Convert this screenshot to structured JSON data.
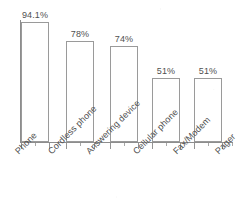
{
  "chart_data": {
    "type": "bar",
    "title": "",
    "subtitle": "",
    "xlabel": "",
    "ylabel": "",
    "categories": [
      "Phone",
      "Cordless phone",
      "Answering device",
      "Cellular phone",
      "Fax/Modem",
      "Pager"
    ],
    "values": [
      94.1,
      78,
      74,
      51,
      51,
      28
    ],
    "value_labels": [
      "94.1%",
      "78%",
      "74%",
      "51%",
      "51%",
      "28%"
    ],
    "ylim": [
      0,
      100
    ],
    "grid": false,
    "legend": null,
    "y_tick_labels": [],
    "orientation": "vertical",
    "bar_fill": "#ffffff",
    "bar_stroke": "#9a9a9a",
    "axis_color": "#8d8d8d",
    "text_color": "#4f4f4f",
    "label_rotation_deg": -45,
    "bars": [
      {
        "category": "Phone",
        "value": 94.1,
        "label": "94.1%",
        "x": 21,
        "width": 28,
        "top": 22,
        "value_label_x": 17,
        "value_label_y": 10,
        "value_label_w": 36
      },
      {
        "category": "Cordless phone",
        "value": 78,
        "label": "78%",
        "x": 66,
        "width": 28,
        "top": 41,
        "value_label_x": 65,
        "value_label_y": 29,
        "value_label_w": 30
      },
      {
        "category": "Answering device",
        "value": 74,
        "label": "74%",
        "x": 110,
        "width": 28,
        "top": 46,
        "value_label_x": 109,
        "value_label_y": 34,
        "value_label_w": 30
      },
      {
        "category": "Cellular phone",
        "value": 51,
        "label": "51%",
        "x": 152,
        "width": 28,
        "top": 78,
        "value_label_x": 151,
        "value_label_y": 66,
        "value_label_w": 30
      },
      {
        "category": "Fax/Modem",
        "value": 51,
        "label": "51%",
        "x": 194,
        "width": 28,
        "top": 78,
        "value_label_x": 193,
        "value_label_y": 66,
        "value_label_w": 30
      },
      {
        "category": "Pager",
        "value": 28,
        "label": "28%",
        "x": 252,
        "width": 28,
        "top": 110,
        "value_label_x": 251,
        "value_label_y": 98,
        "value_label_w": 30
      }
    ],
    "category_label_positions": [
      {
        "label": "Phone",
        "x": 13,
        "y": 149
      },
      {
        "label": "Cordless phone",
        "x": 46,
        "y": 149
      },
      {
        "label": "Answering device",
        "x": 84,
        "y": 149
      },
      {
        "label": "Cellular phone",
        "x": 131,
        "y": 149
      },
      {
        "label": "Fax/Modem",
        "x": 171,
        "y": 149
      },
      {
        "label": "Pager",
        "x": 213,
        "y": 149
      }
    ],
    "tick_major_x": [
      21,
      49,
      66,
      94,
      110,
      138,
      152,
      180,
      194,
      222
    ],
    "tick_minor_x": [
      35,
      80,
      124,
      166,
      208,
      232
    ],
    "axis": {
      "y_line_x": 20,
      "y_line_top": 20,
      "y_line_height": 123,
      "x_line_y": 142,
      "x_line_left": 20,
      "x_line_width": 213
    }
  }
}
